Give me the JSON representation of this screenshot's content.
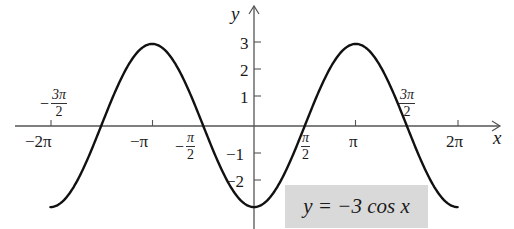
{
  "chart_data": {
    "type": "line",
    "title": "",
    "equation": "y = −3 cos x",
    "xlabel": "x",
    "ylabel": "y",
    "xlim": [
      -6.2832,
      6.2832
    ],
    "ylim": [
      -3,
      3
    ],
    "grid": false,
    "legend": null,
    "x_ticks": [
      {
        "value": -6.2832,
        "label": "−2π"
      },
      {
        "value": -4.7124,
        "label": "−3π/2"
      },
      {
        "value": -3.1416,
        "label": "−π"
      },
      {
        "value": -1.5708,
        "label": "−π/2"
      },
      {
        "value": 1.5708,
        "label": "π/2"
      },
      {
        "value": 3.1416,
        "label": "π"
      },
      {
        "value": 4.7124,
        "label": "3π/2"
      },
      {
        "value": 6.2832,
        "label": "2π"
      }
    ],
    "y_ticks": [
      {
        "value": 3,
        "label": "3"
      },
      {
        "value": 2,
        "label": "2"
      },
      {
        "value": 1,
        "label": "1"
      },
      {
        "value": -1,
        "label": "−1"
      },
      {
        "value": -2,
        "label": "−2"
      }
    ],
    "series": [
      {
        "name": "y = −3 cos x",
        "function": "-3*cos(x)",
        "x": [
          -6.2832,
          -4.7124,
          -3.1416,
          -1.5708,
          0,
          1.5708,
          3.1416,
          4.7124,
          6.2832
        ],
        "values": [
          -3,
          0,
          3,
          0,
          -3,
          0,
          3,
          0,
          -3
        ]
      }
    ]
  },
  "labels": {
    "x_axis": "x",
    "y_axis": "y",
    "neg_two_pi": "−2π",
    "neg_pi": "−π",
    "pi": "π",
    "two_pi": "2π",
    "neg_three_pi_half": {
      "sign": "−",
      "num": "3π",
      "den": "2"
    },
    "neg_pi_half": {
      "sign": "−",
      "num": "π",
      "den": "2"
    },
    "pi_half": {
      "num": "π",
      "den": "2"
    },
    "three_pi_half": {
      "num": "3π",
      "den": "2"
    },
    "y3": "3",
    "y2": "2",
    "y1": "1",
    "ym1": "−1",
    "ym2": "−2",
    "equation": "y = −3 cos x"
  },
  "colors": {
    "curve": "#111111",
    "axis": "#555555",
    "label_box": "#d9d9d9"
  }
}
